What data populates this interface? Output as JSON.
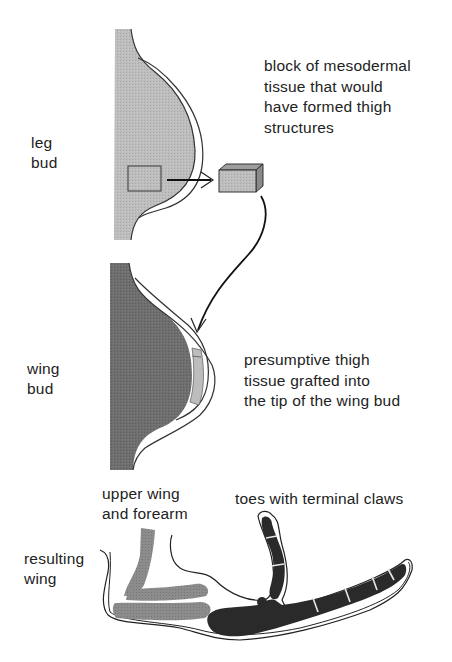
{
  "diagram": {
    "type": "limb-bud-grafting-experiment",
    "stages": [
      {
        "id": "leg-bud",
        "label": "leg\nbud",
        "fill_color": "#b9b9b9"
      },
      {
        "id": "wing-bud",
        "label": "wing\nbud",
        "fill_color": "#6e6e6e",
        "graft_fill_color": "#bdbdbd"
      },
      {
        "id": "resulting-wing",
        "label": "resulting\nwing",
        "upper_bone_color": "#8a8a8a",
        "toe_bone_color": "#2c2c2c"
      }
    ],
    "annotations": {
      "mesoderm_block": "block of mesodermal\ntissue that would\nhave formed thigh\nstructures",
      "graft": "presumptive thigh\ntissue grafted into\nthe tip of the wing bud",
      "upper_wing": "upper wing\nand forearm",
      "toes": "toes with terminal claws"
    },
    "arrows": [
      {
        "from": "leg-bud-square",
        "to": "mesoderm-block-cube"
      },
      {
        "from": "mesoderm-block-cube",
        "to": "wing-bud-tip"
      }
    ]
  }
}
